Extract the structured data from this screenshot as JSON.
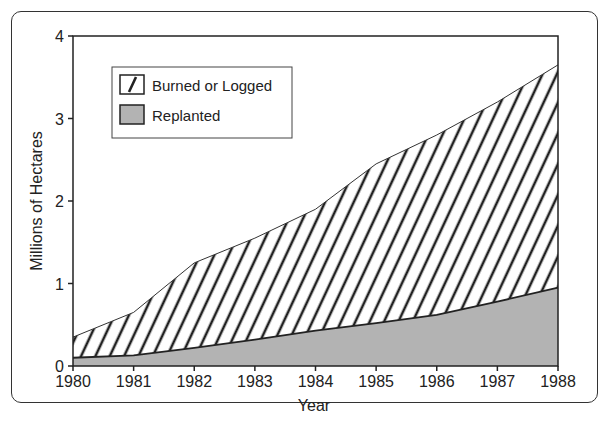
{
  "chart_data": {
    "type": "area",
    "title": "",
    "xlabel": "Year",
    "ylabel": "Millions of Hectares",
    "x": [
      1980,
      1981,
      1982,
      1983,
      1984,
      1985,
      1986,
      1987,
      1988
    ],
    "xticks": [
      "1980",
      "1981",
      "1982",
      "1983",
      "1984",
      "1985",
      "1986",
      "1987",
      "1988"
    ],
    "yticks": [
      "0",
      "1",
      "2",
      "3",
      "4"
    ],
    "ylim": [
      0,
      4
    ],
    "xlim": [
      1980,
      1988
    ],
    "grid": false,
    "legend_position": "upper-left",
    "series": [
      {
        "name": "Burned or Logged",
        "pattern": "diagonal-hatch",
        "values": [
          0.35,
          0.65,
          1.25,
          1.55,
          1.9,
          2.45,
          2.8,
          3.2,
          3.65
        ]
      },
      {
        "name": "Replanted",
        "pattern": "solid-gray",
        "color": "#b3b3b3",
        "values": [
          0.1,
          0.13,
          0.22,
          0.32,
          0.43,
          0.52,
          0.62,
          0.78,
          0.95
        ]
      }
    ]
  },
  "legend": {
    "items": [
      {
        "label": "Burned or Logged"
      },
      {
        "label": "Replanted"
      }
    ]
  },
  "axes": {
    "xlabel": "Year",
    "ylabel": "Millions of Hectares"
  }
}
